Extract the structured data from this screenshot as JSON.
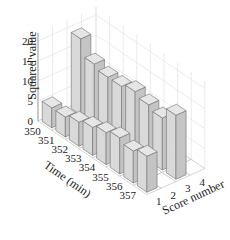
{
  "chart_data": {
    "type": "bar3d",
    "title": "",
    "xlabel": "Time (min)",
    "ylabel": "Score number",
    "zlabel": "Squared value",
    "x_ticks": [
      "350",
      "351",
      "352",
      "353",
      "354",
      "355",
      "356",
      "357"
    ],
    "y_ticks": [
      "1",
      "2",
      "3",
      "4"
    ],
    "z_ticks": [
      "0",
      "5",
      "10",
      "15",
      "20"
    ],
    "zlim": [
      0,
      22
    ],
    "grid": true,
    "series": [
      {
        "name": "Score 1",
        "score": 1,
        "values": [
          5,
          5,
          6,
          7,
          8,
          9,
          8,
          9
        ]
      },
      {
        "name": "Score 3",
        "score": 3,
        "values": [
          19,
          15,
          14,
          14,
          15,
          14,
          13,
          16
        ]
      }
    ],
    "colors": {
      "bar_top": "#e6e6e6",
      "bar_front": "#d9d9d9",
      "bar_side": "#c4c4c4",
      "edge": "#6e6e6e",
      "grid": "#e3e3e3",
      "floor_edge": "#9a9a9a"
    }
  }
}
